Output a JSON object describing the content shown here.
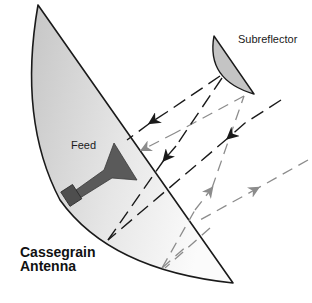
{
  "diagram": {
    "title_line1": "Cassegrain",
    "title_line2": "Antenna",
    "labels": {
      "subreflector": "Subreflector",
      "feed": "Feed"
    },
    "components": [
      {
        "name": "main-reflector",
        "description": "Large parabolic main dish shown in cross-section"
      },
      {
        "name": "subreflector",
        "description": "Small convex secondary reflector"
      },
      {
        "name": "feed-horn",
        "description": "Horn feed antenna at the focal region of the main reflector"
      }
    ],
    "ray_paths": [
      {
        "type": "incoming",
        "color": "gray",
        "description": "Plane wave rays arrive from the right and hit the main reflector"
      },
      {
        "type": "reflected",
        "color": "gray",
        "description": "Rays reflect off main reflector toward subreflector"
      },
      {
        "type": "feed-path",
        "color": "black",
        "description": "Rays reflected from subreflector converge to the feed"
      }
    ],
    "colors": {
      "outline": "#1a1a1a",
      "dish_fill_light": "#f4f4f4",
      "dish_fill_dark": "#c8c8c8",
      "subreflector_fill": "#c4c4c4",
      "feed_fill": "#5a5a5a",
      "black_ray": "#1a1a1a",
      "gray_ray": "#8c8c8c"
    }
  }
}
